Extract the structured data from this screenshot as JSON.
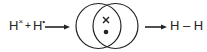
{
  "diagram": {
    "type": "covalent-bond-formation",
    "reactants": {
      "atom1": {
        "symbol": "H",
        "electron_marker": "×"
      },
      "plus": "+",
      "atom2": {
        "symbol": "H",
        "electron_marker": "•"
      }
    },
    "shared_pair": {
      "electron1": "×",
      "electron2": "•"
    },
    "product": "H – H",
    "colors": {
      "stroke": "#222222",
      "background": "#ffffff"
    }
  }
}
